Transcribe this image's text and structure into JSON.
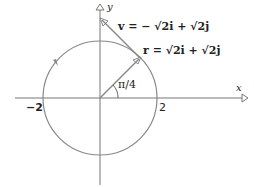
{
  "diagram": {
    "axes": {
      "x_label": "x",
      "y_label": "y"
    },
    "ticks": {
      "neg2": "−2",
      "pos2": "2"
    },
    "angle_label": "π/4",
    "v_label": "v = − √2i + √2j",
    "r_label": "r = √2i + √2j",
    "circle": {
      "radius": 2,
      "center": [
        0,
        0
      ],
      "direction": "counterclockwise"
    },
    "colors": {
      "line": "#777777",
      "text": "#222222"
    }
  }
}
